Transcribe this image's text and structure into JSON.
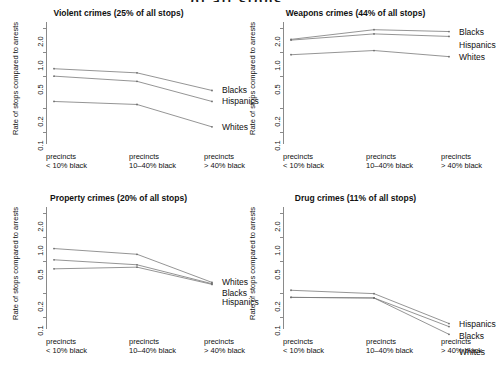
{
  "figure": {
    "supertitle": "of all stops",
    "ylabel": "Rate of stops compared to arrests",
    "y_ticks": [
      "0.1",
      "0.2",
      "0.5",
      "1.0",
      "2.0"
    ],
    "x_categories": [
      {
        "line1": "precincts",
        "line2": "< 10% black"
      },
      {
        "line1": "precincts",
        "line2": "10–40% black"
      },
      {
        "line1": "precincts",
        "line2": "> 40% black"
      }
    ]
  },
  "chart_data": {
    "type": "line",
    "ylabel": "Rate of stops compared to arrests",
    "xlabel": "",
    "yscale": "log",
    "ylim": [
      0.07,
      2.4
    ],
    "ytick_values": [
      0.1,
      0.2,
      0.5,
      1.0,
      2.0
    ],
    "ytick_labels": [
      "0.1",
      "0.2",
      "0.5",
      "1.0",
      "2.0"
    ],
    "grid": false,
    "legend_position": "right-inline",
    "categories": [
      "precincts < 10% black",
      "precincts 10-40% black",
      "precincts > 40% black"
    ],
    "panels": [
      {
        "id": "violent",
        "title": "Violent crimes (25% of all stops)",
        "crime_type": "Violent crimes",
        "share_of_stops": "25% of all stops",
        "series": [
          {
            "name": "Blacks",
            "values": [
              0.62,
              0.55,
              0.33
            ]
          },
          {
            "name": "Hispanics",
            "values": [
              0.5,
              0.43,
              0.24
            ]
          },
          {
            "name": "Whites",
            "values": [
              0.24,
              0.22,
              0.115
            ]
          }
        ]
      },
      {
        "id": "weapons",
        "title": "Weapons crimes (44% of all stops)",
        "crime_type": "Weapons crimes",
        "share_of_stops": "44% of all stops",
        "series": [
          {
            "name": "Blacks",
            "values": [
              1.45,
              1.92,
              1.82
            ]
          },
          {
            "name": "Hispanics",
            "values": [
              1.42,
              1.7,
              1.58
            ]
          },
          {
            "name": "Whites",
            "values": [
              0.93,
              1.05,
              0.88
            ]
          }
        ]
      },
      {
        "id": "property",
        "title": "Property crimes (20% of all stops)",
        "crime_type": "Property crimes",
        "share_of_stops": "20% of all stops",
        "series": [
          {
            "name": "Whites",
            "values": [
              0.72,
              0.61,
              0.27
            ]
          },
          {
            "name": "Blacks",
            "values": [
              0.52,
              0.45,
              0.26
            ]
          },
          {
            "name": "Hispanics",
            "values": [
              0.4,
              0.42,
              0.255
            ]
          }
        ]
      },
      {
        "id": "drug",
        "title": "Drug crimes (11% of all stops)",
        "crime_type": "Drug crimes",
        "share_of_stops": "11% of all stops",
        "series": [
          {
            "name": "Hispanics",
            "values": [
              0.215,
              0.195,
              0.082
            ]
          },
          {
            "name": "Blacks",
            "values": [
              0.175,
              0.172,
              0.075
            ]
          },
          {
            "name": "Whites",
            "values": [
              0.175,
              0.172,
              0.06
            ]
          }
        ]
      }
    ]
  }
}
